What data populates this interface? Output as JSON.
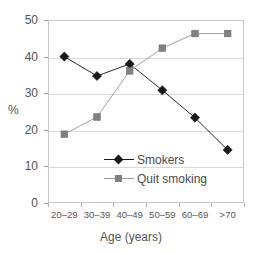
{
  "chart_data": {
    "type": "line",
    "title": "",
    "xlabel": "Age (years)",
    "ylabel": "%",
    "categories": [
      "20–29",
      "30–39",
      "40–49",
      "50–59",
      "60–69",
      ">70"
    ],
    "ylim": [
      0,
      50
    ],
    "yticks": [
      0,
      10,
      20,
      30,
      40,
      50
    ],
    "ytick_labels": [
      "0",
      "10",
      "20",
      "30",
      "40",
      "50"
    ],
    "grid": "horizontal",
    "legend_position": "inside-lower-center",
    "series": [
      {
        "name": "Smokers",
        "marker": "diamond",
        "color": "#1a1a1a",
        "values": [
          40.0,
          34.7,
          38.0,
          30.8,
          23.3,
          14.5
        ]
      },
      {
        "name": "Quit smoking",
        "marker": "square",
        "color": "#808080",
        "values": [
          18.8,
          23.5,
          36.1,
          42.3,
          46.3,
          46.3
        ]
      }
    ]
  },
  "legend": {
    "items": [
      {
        "label": "Smokers",
        "marker": "diamond-marker-icon",
        "color": "#1a1a1a"
      },
      {
        "label": "Quit smoking",
        "marker": "square-marker-icon",
        "color": "#808080"
      }
    ]
  },
  "axes": {
    "x_title": "Age (years)",
    "y_title": "%"
  }
}
